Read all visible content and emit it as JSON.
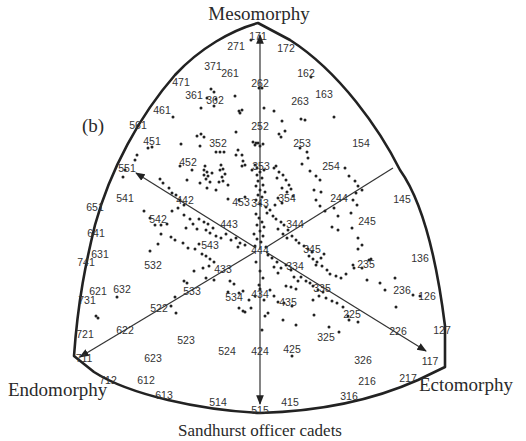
{
  "figure": {
    "panel_label": "(b)",
    "caption": "Sandhurst officer cadets",
    "axes": {
      "mesomorphy": "Mesomorphy",
      "endomorphy": "Endomorphy",
      "ectomorphy": "Ectomorphy"
    },
    "colors": {
      "ink": "#222222",
      "background": "#ffffff"
    }
  },
  "somatotype_labels": [
    {
      "code": "171",
      "x": 258,
      "y": 36
    },
    {
      "code": "271",
      "x": 236,
      "y": 46
    },
    {
      "code": "172",
      "x": 286,
      "y": 48
    },
    {
      "code": "371",
      "x": 213,
      "y": 66
    },
    {
      "code": "261",
      "x": 230,
      "y": 73
    },
    {
      "code": "162",
      "x": 306,
      "y": 73
    },
    {
      "code": "471",
      "x": 181,
      "y": 82
    },
    {
      "code": "262",
      "x": 260,
      "y": 83
    },
    {
      "code": "361",
      "x": 194,
      "y": 95
    },
    {
      "code": "362",
      "x": 215,
      "y": 100
    },
    {
      "code": "263",
      "x": 300,
      "y": 101
    },
    {
      "code": "163",
      "x": 324,
      "y": 94
    },
    {
      "code": "461",
      "x": 162,
      "y": 110
    },
    {
      "code": "561",
      "x": 138,
      "y": 125
    },
    {
      "code": "252",
      "x": 260,
      "y": 126
    },
    {
      "code": "451",
      "x": 152,
      "y": 141
    },
    {
      "code": "352",
      "x": 218,
      "y": 143
    },
    {
      "code": "253",
      "x": 302,
      "y": 143
    },
    {
      "code": "154",
      "x": 361,
      "y": 143
    },
    {
      "code": "551",
      "x": 127,
      "y": 168
    },
    {
      "code": "452",
      "x": 188,
      "y": 162
    },
    {
      "code": "353",
      "x": 261,
      "y": 166
    },
    {
      "code": "254",
      "x": 331,
      "y": 166
    },
    {
      "code": "541",
      "x": 125,
      "y": 198
    },
    {
      "code": "442",
      "x": 185,
      "y": 200
    },
    {
      "code": "453",
      "x": 241,
      "y": 202
    },
    {
      "code": "343",
      "x": 260,
      "y": 203
    },
    {
      "code": "354",
      "x": 287,
      "y": 198
    },
    {
      "code": "244",
      "x": 339,
      "y": 198
    },
    {
      "code": "145",
      "x": 402,
      "y": 199
    },
    {
      "code": "651",
      "x": 95,
      "y": 207
    },
    {
      "code": "542",
      "x": 158,
      "y": 219
    },
    {
      "code": "443",
      "x": 229,
      "y": 224
    },
    {
      "code": "344",
      "x": 295,
      "y": 224
    },
    {
      "code": "245",
      "x": 367,
      "y": 221
    },
    {
      "code": "641",
      "x": 96,
      "y": 233
    },
    {
      "code": "631",
      "x": 100,
      "y": 254
    },
    {
      "code": "543",
      "x": 210,
      "y": 245
    },
    {
      "code": "444",
      "x": 260,
      "y": 250
    },
    {
      "code": "345",
      "x": 312,
      "y": 249
    },
    {
      "code": "741",
      "x": 86,
      "y": 262
    },
    {
      "code": "532",
      "x": 153,
      "y": 265
    },
    {
      "code": "433",
      "x": 223,
      "y": 269
    },
    {
      "code": "334",
      "x": 295,
      "y": 266
    },
    {
      "code": "235",
      "x": 366,
      "y": 264
    },
    {
      "code": "136",
      "x": 420,
      "y": 258
    },
    {
      "code": "621",
      "x": 98,
      "y": 291
    },
    {
      "code": "632",
      "x": 122,
      "y": 289
    },
    {
      "code": "533",
      "x": 192,
      "y": 291
    },
    {
      "code": "335",
      "x": 322,
      "y": 288
    },
    {
      "code": "236",
      "x": 402,
      "y": 290
    },
    {
      "code": "126",
      "x": 427,
      "y": 296
    },
    {
      "code": "731",
      "x": 87,
      "y": 300
    },
    {
      "code": "534",
      "x": 234,
      "y": 297
    },
    {
      "code": "434",
      "x": 260,
      "y": 294
    },
    {
      "code": "435",
      "x": 288,
      "y": 302
    },
    {
      "code": "522",
      "x": 159,
      "y": 308
    },
    {
      "code": "225",
      "x": 352,
      "y": 314
    },
    {
      "code": "622",
      "x": 125,
      "y": 330
    },
    {
      "code": "721",
      "x": 85,
      "y": 334
    },
    {
      "code": "523",
      "x": 186,
      "y": 340
    },
    {
      "code": "325",
      "x": 326,
      "y": 337
    },
    {
      "code": "226",
      "x": 398,
      "y": 331
    },
    {
      "code": "127",
      "x": 442,
      "y": 330
    },
    {
      "code": "524",
      "x": 227,
      "y": 351
    },
    {
      "code": "424",
      "x": 260,
      "y": 351
    },
    {
      "code": "425",
      "x": 292,
      "y": 349
    },
    {
      "code": "711",
      "x": 84,
      "y": 358
    },
    {
      "code": "623",
      "x": 153,
      "y": 358
    },
    {
      "code": "326",
      "x": 363,
      "y": 360
    },
    {
      "code": "117",
      "x": 430,
      "y": 361
    },
    {
      "code": "712",
      "x": 108,
      "y": 380
    },
    {
      "code": "612",
      "x": 146,
      "y": 380
    },
    {
      "code": "216",
      "x": 367,
      "y": 381
    },
    {
      "code": "217",
      "x": 408,
      "y": 378
    },
    {
      "code": "613",
      "x": 164,
      "y": 395
    },
    {
      "code": "514",
      "x": 218,
      "y": 402
    },
    {
      "code": "415",
      "x": 290,
      "y": 402
    },
    {
      "code": "316",
      "x": 349,
      "y": 396
    },
    {
      "code": "515",
      "x": 260,
      "y": 410
    }
  ],
  "data_points": [
    [
      251,
      40
    ],
    [
      274,
      111
    ],
    [
      211,
      89
    ],
    [
      214,
      92
    ],
    [
      207,
      98
    ],
    [
      216,
      99
    ],
    [
      201,
      108
    ],
    [
      214,
      106
    ],
    [
      235,
      96
    ],
    [
      239,
      111
    ],
    [
      242,
      110
    ],
    [
      240,
      113
    ],
    [
      173,
      117
    ],
    [
      259,
      88
    ],
    [
      262,
      88
    ],
    [
      311,
      77
    ],
    [
      334,
      117
    ],
    [
      301,
      119
    ],
    [
      305,
      120
    ],
    [
      264,
      108
    ],
    [
      282,
      121
    ],
    [
      279,
      134
    ],
    [
      285,
      131
    ],
    [
      281,
      137
    ],
    [
      300,
      148
    ],
    [
      148,
      148
    ],
    [
      152,
      147
    ],
    [
      181,
      144
    ],
    [
      197,
      136
    ],
    [
      201,
      134
    ],
    [
      204,
      137
    ],
    [
      236,
      132
    ],
    [
      216,
      152
    ],
    [
      220,
      152
    ],
    [
      224,
      152
    ],
    [
      200,
      146
    ],
    [
      180,
      166
    ],
    [
      253,
      142
    ],
    [
      256,
      143
    ],
    [
      258,
      143
    ],
    [
      255,
      145
    ],
    [
      260,
      146
    ],
    [
      263,
      144
    ],
    [
      236,
      155
    ],
    [
      238,
      150
    ],
    [
      242,
      155
    ],
    [
      243,
      161
    ],
    [
      245,
      165
    ],
    [
      242,
      166
    ],
    [
      205,
      166
    ],
    [
      204,
      170
    ],
    [
      207,
      172
    ],
    [
      204,
      175
    ],
    [
      208,
      176
    ],
    [
      206,
      179
    ],
    [
      210,
      182
    ],
    [
      212,
      173
    ],
    [
      207,
      188
    ],
    [
      192,
      170
    ],
    [
      187,
      180
    ],
    [
      200,
      183
    ],
    [
      221,
      165
    ],
    [
      223,
      169
    ],
    [
      220,
      170
    ],
    [
      225,
      174
    ],
    [
      222,
      177
    ],
    [
      223,
      181
    ],
    [
      219,
      182
    ],
    [
      228,
      185
    ],
    [
      216,
      190
    ],
    [
      228,
      199
    ],
    [
      239,
      200
    ],
    [
      245,
      197
    ],
    [
      255,
      165
    ],
    [
      257,
      168
    ],
    [
      252,
      170
    ],
    [
      260,
      172
    ],
    [
      264,
      170
    ],
    [
      257,
      175
    ],
    [
      262,
      178
    ],
    [
      258,
      181
    ],
    [
      263,
      185
    ],
    [
      256,
      186
    ],
    [
      260,
      190
    ],
    [
      265,
      192
    ],
    [
      258,
      195
    ],
    [
      262,
      197
    ],
    [
      256,
      200
    ],
    [
      260,
      204
    ],
    [
      266,
      207
    ],
    [
      274,
      168
    ],
    [
      276,
      166
    ],
    [
      279,
      172
    ],
    [
      283,
      175
    ],
    [
      277,
      178
    ],
    [
      286,
      180
    ],
    [
      289,
      185
    ],
    [
      282,
      188
    ],
    [
      291,
      189
    ],
    [
      287,
      192
    ],
    [
      293,
      196
    ],
    [
      278,
      198
    ],
    [
      275,
      205
    ],
    [
      282,
      203
    ],
    [
      307,
      152
    ],
    [
      308,
      158
    ],
    [
      302,
      164
    ],
    [
      310,
      171
    ],
    [
      316,
      176
    ],
    [
      320,
      180
    ],
    [
      314,
      190
    ],
    [
      321,
      192
    ],
    [
      316,
      200
    ],
    [
      320,
      206
    ],
    [
      325,
      211
    ],
    [
      334,
      208
    ],
    [
      338,
      216
    ],
    [
      345,
      168
    ],
    [
      349,
      176
    ],
    [
      355,
      181
    ],
    [
      358,
      186
    ],
    [
      362,
      190
    ],
    [
      356,
      193
    ],
    [
      353,
      200
    ],
    [
      357,
      205
    ],
    [
      351,
      213
    ],
    [
      332,
      227
    ],
    [
      338,
      230
    ],
    [
      352,
      228
    ],
    [
      358,
      238
    ],
    [
      362,
      245
    ],
    [
      358,
      249
    ],
    [
      160,
      179
    ],
    [
      163,
      183
    ],
    [
      169,
      188
    ],
    [
      172,
      193
    ],
    [
      176,
      195
    ],
    [
      180,
      200
    ],
    [
      184,
      205
    ],
    [
      178,
      208
    ],
    [
      172,
      211
    ],
    [
      184,
      215
    ],
    [
      190,
      219
    ],
    [
      193,
      224
    ],
    [
      186,
      228
    ],
    [
      197,
      229
    ],
    [
      199,
      219
    ],
    [
      204,
      222
    ],
    [
      208,
      224
    ],
    [
      206,
      230
    ],
    [
      210,
      233
    ],
    [
      213,
      228
    ],
    [
      216,
      236
    ],
    [
      221,
      238
    ],
    [
      226,
      234
    ],
    [
      231,
      240
    ],
    [
      236,
      238
    ],
    [
      240,
      243
    ],
    [
      245,
      245
    ],
    [
      238,
      247
    ],
    [
      144,
      211
    ],
    [
      150,
      218
    ],
    [
      155,
      225
    ],
    [
      161,
      225
    ],
    [
      167,
      224
    ],
    [
      161,
      234
    ],
    [
      158,
      244
    ],
    [
      150,
      251
    ],
    [
      171,
      237
    ],
    [
      175,
      240
    ],
    [
      183,
      243
    ],
    [
      188,
      248
    ],
    [
      195,
      249
    ],
    [
      199,
      244
    ],
    [
      202,
      254
    ],
    [
      206,
      256
    ],
    [
      210,
      259
    ],
    [
      214,
      262
    ],
    [
      209,
      266
    ],
    [
      203,
      268
    ],
    [
      194,
      271
    ],
    [
      184,
      281
    ],
    [
      187,
      283
    ],
    [
      175,
      297
    ],
    [
      171,
      306
    ],
    [
      176,
      313
    ],
    [
      206,
      278
    ],
    [
      214,
      280
    ],
    [
      256,
      214
    ],
    [
      259,
      218
    ],
    [
      262,
      222
    ],
    [
      257,
      225
    ],
    [
      264,
      227
    ],
    [
      260,
      231
    ],
    [
      254,
      234
    ],
    [
      263,
      236
    ],
    [
      257,
      239
    ],
    [
      261,
      242
    ],
    [
      255,
      246
    ],
    [
      266,
      247
    ],
    [
      267,
      213
    ],
    [
      270,
      210
    ],
    [
      273,
      216
    ],
    [
      276,
      219
    ],
    [
      281,
      222
    ],
    [
      284,
      225
    ],
    [
      278,
      229
    ],
    [
      288,
      230
    ],
    [
      283,
      234
    ],
    [
      287,
      238
    ],
    [
      292,
      236
    ],
    [
      296,
      240
    ],
    [
      299,
      243
    ],
    [
      268,
      255
    ],
    [
      272,
      258
    ],
    [
      277,
      262
    ],
    [
      274,
      267
    ],
    [
      281,
      268
    ],
    [
      286,
      265
    ],
    [
      291,
      270
    ],
    [
      278,
      273
    ],
    [
      294,
      277
    ],
    [
      298,
      281
    ],
    [
      286,
      286
    ],
    [
      291,
      287
    ],
    [
      296,
      289
    ],
    [
      304,
      246
    ],
    [
      308,
      249
    ],
    [
      312,
      252
    ],
    [
      309,
      256
    ],
    [
      313,
      259
    ],
    [
      317,
      262
    ],
    [
      321,
      258
    ],
    [
      324,
      254
    ],
    [
      316,
      265
    ],
    [
      322,
      266
    ],
    [
      327,
      270
    ],
    [
      330,
      274
    ],
    [
      301,
      277
    ],
    [
      306,
      281
    ],
    [
      310,
      283
    ],
    [
      313,
      286
    ],
    [
      318,
      290
    ],
    [
      323,
      292
    ],
    [
      319,
      296
    ],
    [
      313,
      300
    ],
    [
      326,
      298
    ],
    [
      332,
      301
    ],
    [
      337,
      303
    ],
    [
      343,
      307
    ],
    [
      336,
      276
    ],
    [
      341,
      278
    ],
    [
      346,
      274
    ],
    [
      353,
      265
    ],
    [
      354,
      268
    ],
    [
      362,
      268
    ],
    [
      369,
      260
    ],
    [
      371,
      259
    ],
    [
      367,
      280
    ],
    [
      380,
      283
    ],
    [
      385,
      290
    ],
    [
      395,
      278
    ],
    [
      396,
      307
    ],
    [
      413,
      295
    ],
    [
      420,
      296
    ],
    [
      230,
      281
    ],
    [
      234,
      284
    ],
    [
      228,
      292
    ],
    [
      239,
      293
    ],
    [
      243,
      291
    ],
    [
      249,
      300
    ],
    [
      251,
      308
    ],
    [
      255,
      296
    ],
    [
      264,
      300
    ],
    [
      270,
      290
    ],
    [
      274,
      296
    ],
    [
      278,
      302
    ],
    [
      284,
      303
    ],
    [
      292,
      306
    ],
    [
      256,
      262
    ],
    [
      260,
      271
    ],
    [
      263,
      278
    ],
    [
      259,
      285
    ],
    [
      239,
      308
    ],
    [
      245,
      312
    ],
    [
      265,
      316
    ],
    [
      268,
      313
    ],
    [
      283,
      320
    ],
    [
      296,
      325
    ],
    [
      314,
      315
    ],
    [
      329,
      327
    ],
    [
      348,
      316
    ],
    [
      349,
      320
    ],
    [
      358,
      322
    ],
    [
      262,
      330
    ],
    [
      292,
      356
    ],
    [
      339,
      332
    ],
    [
      117,
      297
    ],
    [
      96,
      316
    ],
    [
      98,
      318
    ],
    [
      125,
      170
    ],
    [
      137,
      155
    ],
    [
      135,
      160
    ],
    [
      123,
      177
    ],
    [
      243,
      311
    ],
    [
      260,
      289
    ]
  ]
}
